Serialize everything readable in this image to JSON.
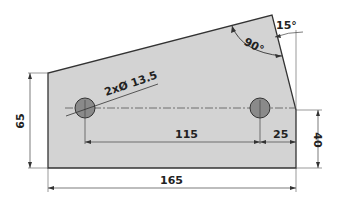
{
  "drawing": {
    "type": "mechanical-plate-dimension-drawing",
    "colors": {
      "plate_fill": "#d3d3d3",
      "hole_fill": "#8a8a8a",
      "line": "#333333",
      "dim_line": "#555555",
      "background": "#ffffff"
    },
    "hole_callout": "2xØ 13.5",
    "dimensions": {
      "overall_width": "165",
      "left_height": "65",
      "right_height": "40",
      "hole_spacing": "115",
      "hole_edge_offset": "25",
      "slant_angle": "15°",
      "corner_angle": "90°"
    },
    "holes": [
      {
        "name": "left-hole",
        "diameter": "13.5"
      },
      {
        "name": "right-hole",
        "diameter": "13.5"
      }
    ]
  }
}
